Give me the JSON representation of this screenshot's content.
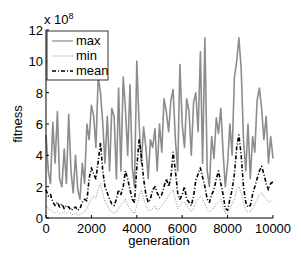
{
  "chart_data": {
    "type": "line",
    "title": "",
    "xlabel": "generation",
    "ylabel": "fitness",
    "y_exponent_label": "x 10",
    "y_exponent_power": "8",
    "xlim": [
      0,
      10000
    ],
    "ylim": [
      0,
      12
    ],
    "y_scale_factor": 100000000,
    "xticks": [
      0,
      2000,
      4000,
      6000,
      8000,
      10000
    ],
    "xtick_labels": [
      "0",
      "2000",
      "4000",
      "6000",
      "8000",
      "10000"
    ],
    "yticks": [
      0,
      2,
      4,
      6,
      8,
      10,
      12
    ],
    "ytick_labels": [
      "0",
      "2",
      "4",
      "6",
      "8",
      "10",
      "12"
    ],
    "grid": false,
    "legend_position": "upper left",
    "legend": [
      "max",
      "min",
      "mean"
    ],
    "x": [
      0,
      100,
      200,
      300,
      400,
      500,
      600,
      700,
      800,
      900,
      1000,
      1100,
      1200,
      1300,
      1400,
      1500,
      1600,
      1700,
      1800,
      1900,
      2000,
      2100,
      2200,
      2300,
      2400,
      2500,
      2600,
      2700,
      2800,
      2900,
      3000,
      3100,
      3200,
      3300,
      3400,
      3500,
      3600,
      3700,
      3800,
      3900,
      4000,
      4100,
      4200,
      4300,
      4400,
      4500,
      4600,
      4700,
      4800,
      4900,
      5000,
      5100,
      5200,
      5300,
      5400,
      5500,
      5600,
      5700,
      5800,
      5900,
      6000,
      6100,
      6200,
      6300,
      6400,
      6500,
      6600,
      6700,
      6800,
      6900,
      7000,
      7100,
      7200,
      7300,
      7400,
      7500,
      7600,
      7700,
      7800,
      7900,
      8000,
      8100,
      8200,
      8300,
      8400,
      8500,
      8600,
      8700,
      8800,
      8900,
      9000,
      9100,
      9200,
      9300,
      9400,
      9500,
      9600,
      9700,
      9800,
      9900,
      10000
    ],
    "series": [
      {
        "name": "max",
        "color": "#8c8c8c",
        "style": "solid",
        "values": [
          5.3,
          3.0,
          2.2,
          6.1,
          3.5,
          6.8,
          2.5,
          2.0,
          4.4,
          2.2,
          6.6,
          3.0,
          1.6,
          4.0,
          1.8,
          1.2,
          3.5,
          2.2,
          6.0,
          5.0,
          7.2,
          6.5,
          4.5,
          9.0,
          8.0,
          6.0,
          3.5,
          6.5,
          3.0,
          7.0,
          6.5,
          2.5,
          8.3,
          3.0,
          9.0,
          7.0,
          4.0,
          8.5,
          3.2,
          2.0,
          10.0,
          6.0,
          3.5,
          5.8,
          4.5,
          2.5,
          5.0,
          4.5,
          5.7,
          3.0,
          6.0,
          4.2,
          7.6,
          6.8,
          5.5,
          7.5,
          8.2,
          5.0,
          3.0,
          9.8,
          6.0,
          4.5,
          7.6,
          6.8,
          4.0,
          7.4,
          8.0,
          5.5,
          10.6,
          3.5,
          11.5,
          3.0,
          2.0,
          5.2,
          3.8,
          6.4,
          5.4,
          7.0,
          4.2,
          2.0,
          3.5,
          6.0,
          4.0,
          9.0,
          10.0,
          11.5,
          9.5,
          5.0,
          3.0,
          6.0,
          2.5,
          5.2,
          4.2,
          7.5,
          8.3,
          7.0,
          5.0,
          6.5,
          3.5,
          5.2,
          3.8
        ]
      },
      {
        "name": "min",
        "color": "#8c8c8c",
        "style": "dotted",
        "values": [
          0.8,
          0.6,
          0.5,
          0.4,
          0.3,
          0.4,
          0.3,
          0.3,
          0.4,
          0.3,
          0.4,
          0.3,
          0.2,
          0.3,
          0.2,
          0.2,
          0.3,
          0.4,
          0.6,
          0.9,
          1.2,
          1.4,
          1.3,
          1.8,
          2.2,
          1.6,
          1.0,
          0.8,
          0.5,
          0.4,
          0.3,
          0.4,
          0.6,
          0.8,
          1.0,
          1.2,
          0.8,
          0.6,
          0.4,
          0.3,
          0.8,
          1.4,
          1.8,
          1.2,
          0.8,
          0.5,
          0.5,
          0.6,
          0.8,
          0.5,
          0.6,
          0.8,
          1.0,
          1.2,
          1.4,
          1.6,
          1.8,
          1.2,
          0.6,
          0.8,
          1.0,
          1.0,
          0.8,
          0.6,
          0.4,
          0.6,
          1.0,
          1.2,
          1.4,
          1.2,
          0.9,
          0.6,
          0.4,
          0.5,
          0.7,
          0.9,
          1.0,
          1.2,
          0.8,
          0.3,
          0.3,
          0.6,
          0.9,
          1.2,
          1.8,
          2.0,
          1.6,
          1.0,
          0.5,
          0.4,
          0.4,
          0.6,
          0.9,
          1.2,
          1.5,
          1.6,
          1.4,
          1.2,
          1.0,
          1.1,
          1.0
        ]
      },
      {
        "name": "mean",
        "color": "#000000",
        "style": "dash-dot",
        "values": [
          1.8,
          1.4,
          1.5,
          1.0,
          0.8,
          1.0,
          0.7,
          0.9,
          0.6,
          0.8,
          0.7,
          0.5,
          0.6,
          0.7,
          0.5,
          0.6,
          1.0,
          1.2,
          1.1,
          2.5,
          3.2,
          2.8,
          2.5,
          3.6,
          4.8,
          3.0,
          2.0,
          1.6,
          1.2,
          0.9,
          0.8,
          1.2,
          1.8,
          1.5,
          2.0,
          3.0,
          2.5,
          1.8,
          1.2,
          1.0,
          3.2,
          5.0,
          4.0,
          2.5,
          1.5,
          1.0,
          1.2,
          1.8,
          2.0,
          1.6,
          1.3,
          1.5,
          2.0,
          2.5,
          2.0,
          2.6,
          4.2,
          3.0,
          1.6,
          1.2,
          1.5,
          2.0,
          1.2,
          1.0,
          0.8,
          1.4,
          2.4,
          2.8,
          3.2,
          2.6,
          2.0,
          1.2,
          1.0,
          1.5,
          1.8,
          2.5,
          3.0,
          2.2,
          1.5,
          0.6,
          0.5,
          1.2,
          1.8,
          2.8,
          4.5,
          5.3,
          4.0,
          2.0,
          1.0,
          0.7,
          0.8,
          1.5,
          2.0,
          2.5,
          3.0,
          3.3,
          2.8,
          2.2,
          1.8,
          2.2,
          2.3
        ]
      }
    ]
  },
  "plot_area": {
    "x0": 46,
    "x1": 273,
    "y0": 218,
    "y1": 30
  }
}
